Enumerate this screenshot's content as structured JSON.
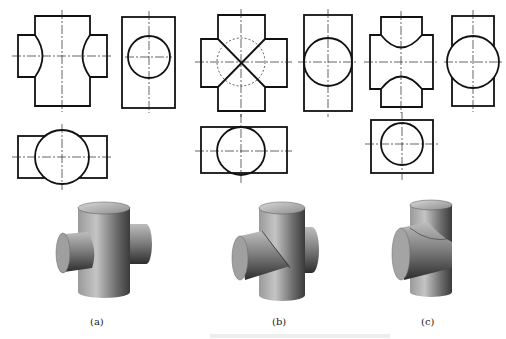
{
  "figure": {
    "panels": [
      {
        "id": "a",
        "label": "(a)",
        "description": "Horizontal cylinder smaller than vertical cylinder, intersecting (three-view + 3D)"
      },
      {
        "id": "b",
        "label": "(b)",
        "description": "Equal-diameter cylinders intersecting (X-shaped intersection lines)"
      },
      {
        "id": "c",
        "label": "(c)",
        "description": "Horizontal cylinder larger than vertical cylinder, intersecting"
      }
    ],
    "views": [
      "front-view",
      "side-view",
      "top-view",
      "isometric-3d"
    ],
    "colors": {
      "line": "#111111",
      "background": "#ffffff",
      "shade_dark": "#3a3a3a",
      "shade_light": "#b8b8b8"
    }
  }
}
